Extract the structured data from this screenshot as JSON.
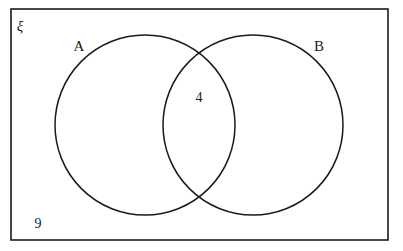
{
  "diagram": {
    "type": "venn-two-set",
    "title_symbol": "ξ",
    "universe_label": "ξ",
    "set_a_label": "A",
    "set_b_label": "B",
    "intersection_count": "4",
    "outside_count": "9",
    "stroke_color": "#1a1a1a",
    "fill_color": "#ffffff",
    "background_color": "#ffffff",
    "regions": [
      {
        "name": "universe-outside",
        "label": "9",
        "value": 9
      },
      {
        "name": "a-only",
        "label": "",
        "value": null
      },
      {
        "name": "a-intersect-b",
        "label": "4",
        "value": 4
      },
      {
        "name": "b-only",
        "label": "",
        "value": null
      }
    ]
  },
  "geometry": {
    "rect_x": "11",
    "rect_y": "9",
    "rect_w": "377",
    "rect_h": "231",
    "circle_a_cx": "145",
    "circle_a_cy": "125",
    "circle_b_cx": "253",
    "circle_b_cy": "125",
    "circle_r": "90",
    "universe_label_x": "20",
    "universe_label_y": "28",
    "set_a_label_x": "79",
    "set_a_label_y": "48",
    "set_b_label_x": "319",
    "set_b_label_y": "48",
    "intersection_label_x": "199",
    "intersection_label_y": "99",
    "outside_label_x": "38",
    "outside_label_y": "225"
  }
}
